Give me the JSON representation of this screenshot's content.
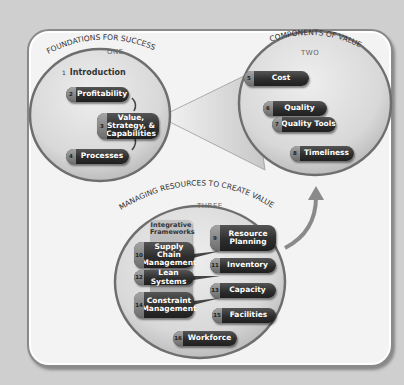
{
  "diagram": {
    "sections": [
      {
        "key": "one",
        "title": "FOUNDATIONS FOR SUCCESS",
        "number_label": "ONE",
        "items": [
          {
            "num": "1",
            "label": "Introduction"
          },
          {
            "num": "2",
            "label": "Profitability"
          },
          {
            "num": "3",
            "label": "Value, Strategy, & Capabilities"
          },
          {
            "num": "4",
            "label": "Processes"
          }
        ]
      },
      {
        "key": "two",
        "title": "COMPONENTS OF VALUE",
        "number_label": "TWO",
        "items": [
          {
            "num": "5",
            "label": "Cost"
          },
          {
            "num": "6",
            "label": "Quality"
          },
          {
            "num": "7",
            "label": "Quality Tools"
          },
          {
            "num": "8",
            "label": "Timeliness"
          }
        ]
      },
      {
        "key": "three",
        "title": "MANAGING RESOURCES TO CREATE VALUE",
        "number_label": "THREE",
        "framework_label": "Integrative Frameworks",
        "items": [
          {
            "num": "9",
            "label": "Resource Planning"
          },
          {
            "num": "10",
            "label": "Supply Chain Management"
          },
          {
            "num": "11",
            "label": "Inventory"
          },
          {
            "num": "12",
            "label": "Lean Systems"
          },
          {
            "num": "13",
            "label": "Capacity"
          },
          {
            "num": "14",
            "label": "Constraint Management"
          },
          {
            "num": "15",
            "label": "Facilities"
          },
          {
            "num": "16",
            "label": "Workforce"
          }
        ]
      }
    ],
    "colors": {
      "background": "#cfcfcf",
      "panel": "#f3f3f3",
      "pill": "#2e2e2e",
      "pill_text": "#ffffff",
      "title_text": "#333333"
    }
  }
}
